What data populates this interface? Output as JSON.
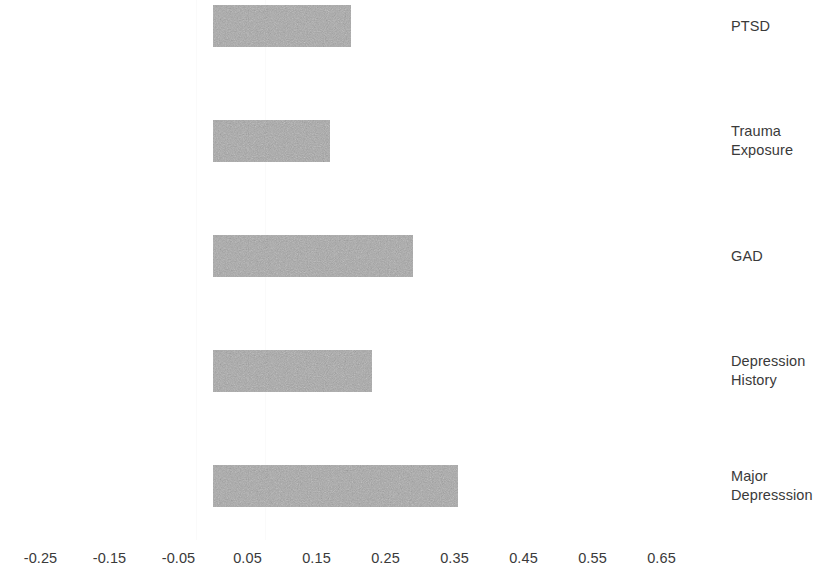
{
  "chart_data": {
    "type": "bar",
    "orientation": "horizontal",
    "title": "",
    "subtitle": "",
    "xlabel": "",
    "ylabel": "",
    "grid": false,
    "legend": null,
    "categories": [
      "PTSD",
      "Trauma Exposure",
      "GAD",
      "Depression History",
      "Major Depresssion"
    ],
    "category_label_lines": [
      "PTSD",
      "Trauma\nExposure",
      "GAD",
      "Depression\nHistory",
      "Major\nDepresssion"
    ],
    "values": [
      0.2,
      0.17,
      0.29,
      0.23,
      0.355
    ],
    "xlim": [
      -0.3,
      0.7
    ],
    "xticks": [
      -0.25,
      -0.15,
      -0.05,
      0.05,
      0.15,
      0.25,
      0.35,
      0.45,
      0.55,
      0.65
    ],
    "xticklabels": [
      "-0.25",
      "-0.15",
      "-0.05",
      "0.05",
      "0.15",
      "0.25",
      "0.35",
      "0.45",
      "0.55",
      "0.65"
    ],
    "bar_color": "#a8a8a8",
    "text_color": "#3a3a3a",
    "background_color": "#ffffff"
  }
}
